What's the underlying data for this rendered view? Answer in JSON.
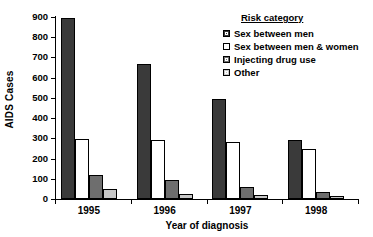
{
  "chart_data": {
    "type": "bar",
    "title": "",
    "xlabel": "Year of diagnosis",
    "ylabel": "AIDS Cases",
    "categories": [
      "1995",
      "1996",
      "1997",
      "1998"
    ],
    "ylim": [
      0,
      900
    ],
    "yticks": [
      "0",
      "100",
      "200",
      "300",
      "400",
      "500",
      "600",
      "700",
      "800",
      "900"
    ],
    "grid": false,
    "legend_position": "top-right",
    "legend_title": "Risk category",
    "series": [
      {
        "name": "Sex between men",
        "color": "#3a3a3a",
        "values": [
          895,
          670,
          493,
          292
        ]
      },
      {
        "name": "Sex between men & women",
        "color": "#ffffff",
        "values": [
          295,
          293,
          282,
          247
        ]
      },
      {
        "name": "Injecting drug use",
        "color": "#6e6e6e",
        "values": [
          120,
          95,
          60,
          33
        ]
      },
      {
        "name": "Other",
        "color": "#c8c8c8",
        "values": [
          48,
          27,
          20,
          13
        ]
      }
    ]
  }
}
